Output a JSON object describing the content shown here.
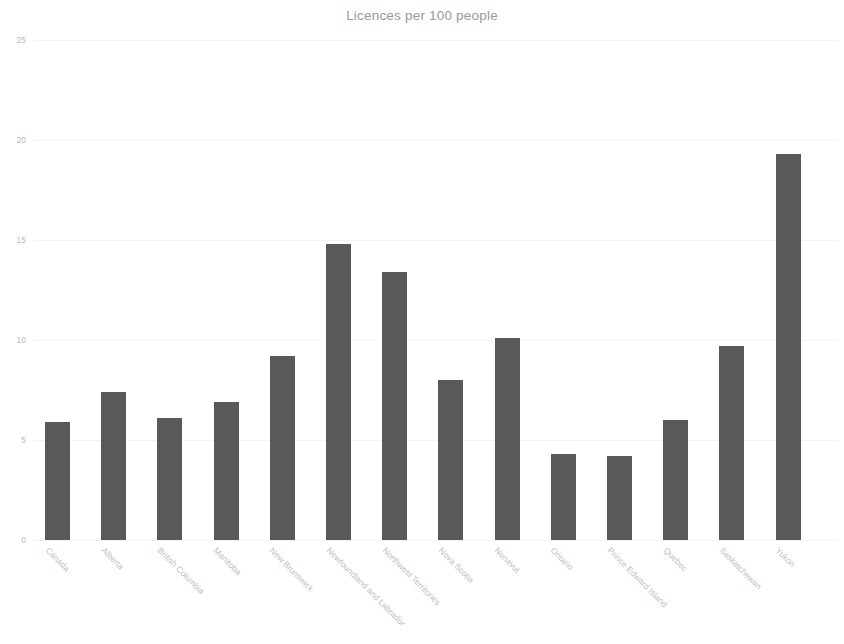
{
  "chart_data": {
    "type": "bar",
    "title": "Licences per 100 people",
    "xlabel": "",
    "ylabel": "",
    "ylim": [
      0,
      25
    ],
    "yticks": [
      0,
      5,
      10,
      15,
      20,
      25
    ],
    "grid": true,
    "legend": false,
    "bar_color": "#595959",
    "categories": [
      "Canada",
      "Alberta",
      "British Columbia",
      "Manitoba",
      "New Brunswick",
      "Newfoundland and Labrador",
      "Northwest Territories",
      "Nova Scotia",
      "Nunavut",
      "Ontario",
      "Prince Edward Island",
      "Quebec",
      "Saskatchewan",
      "Yukon"
    ],
    "values": [
      5.9,
      7.4,
      6.1,
      6.9,
      9.2,
      14.8,
      13.4,
      8.0,
      10.1,
      4.3,
      4.2,
      6.0,
      9.7,
      19.3
    ]
  },
  "axes": {
    "y_tick_labels": [
      "25",
      "20",
      "15",
      "10",
      "5",
      "0"
    ]
  }
}
